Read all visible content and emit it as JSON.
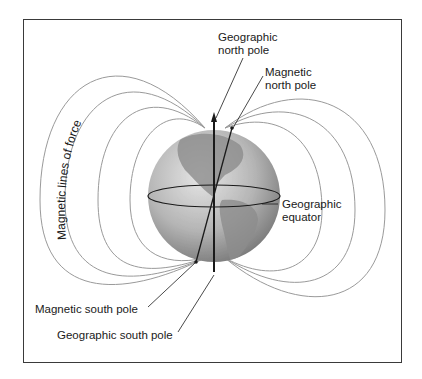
{
  "diagram": {
    "labels": {
      "geographic_north_pole": [
        "Geographic",
        "north pole"
      ],
      "magnetic_north_pole": [
        "Magnetic",
        "north pole"
      ],
      "magnetic_lines_of_force": "Magnetic lines of force",
      "geographic_equator": [
        "Geographic",
        "equator"
      ],
      "magnetic_south_pole": "Magnetic south pole",
      "geographic_south_pole": "Geographic south pole"
    },
    "colors": {
      "field_lines": "#9a9a9a",
      "axis": "#1a1a1a",
      "frame": "#3a3a3a",
      "globe_ocean": "#b8b8b8",
      "globe_land": "#8c8c8c"
    }
  }
}
